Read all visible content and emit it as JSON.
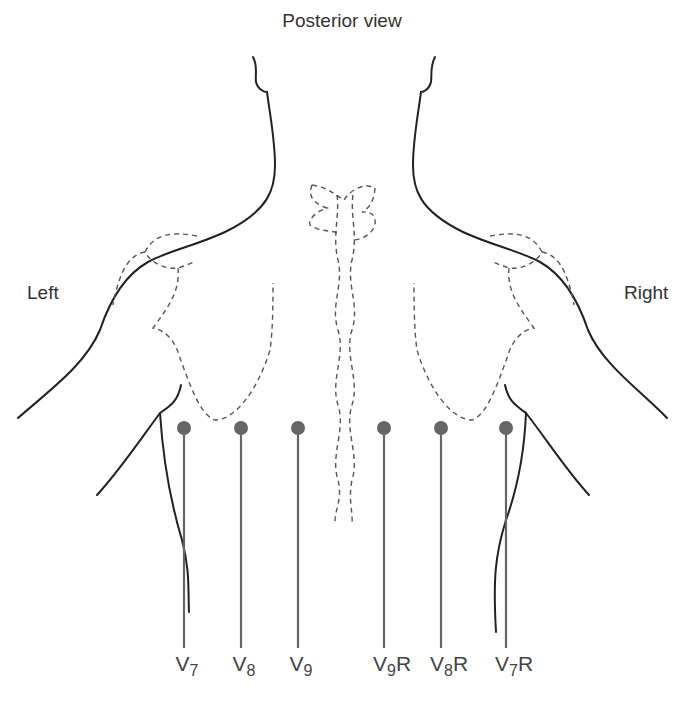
{
  "title": "Posterior view",
  "side_labels": {
    "left": "Left",
    "right": "Right"
  },
  "colors": {
    "outline": "#222222",
    "dashed": "#555555",
    "electrode": "#666666",
    "text": "#333333"
  },
  "electrodes": [
    {
      "id": "V7",
      "base": "V",
      "sub": "7",
      "suffix": "",
      "x": 184
    },
    {
      "id": "V8",
      "base": "V",
      "sub": "8",
      "suffix": "",
      "x": 241
    },
    {
      "id": "V9",
      "base": "V",
      "sub": "9",
      "suffix": "",
      "x": 298
    },
    {
      "id": "V9R",
      "base": "V",
      "sub": "9",
      "suffix": "R",
      "x": 384
    },
    {
      "id": "V8R",
      "base": "V",
      "sub": "8",
      "suffix": "R",
      "x": 441
    },
    {
      "id": "V7R",
      "base": "V",
      "sub": "7",
      "suffix": "R",
      "x": 506
    }
  ]
}
